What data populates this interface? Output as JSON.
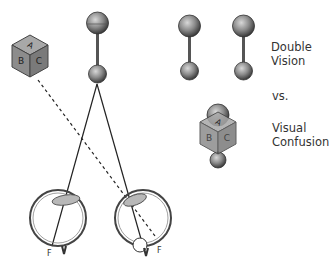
{
  "labels": {
    "double_line1": "Double",
    "double_line2": "Vision",
    "vs": "vs.",
    "confusion_line1": "Visual",
    "confusion_line2": "Confusion",
    "fovea_left": "F",
    "fovea_right": "F"
  },
  "block_letters": {
    "top": "A",
    "left": "B",
    "right": "C"
  },
  "colors": {
    "line": "#222222",
    "object_fill": "#8a8a8a",
    "object_dark": "#444444",
    "text": "#333333"
  }
}
